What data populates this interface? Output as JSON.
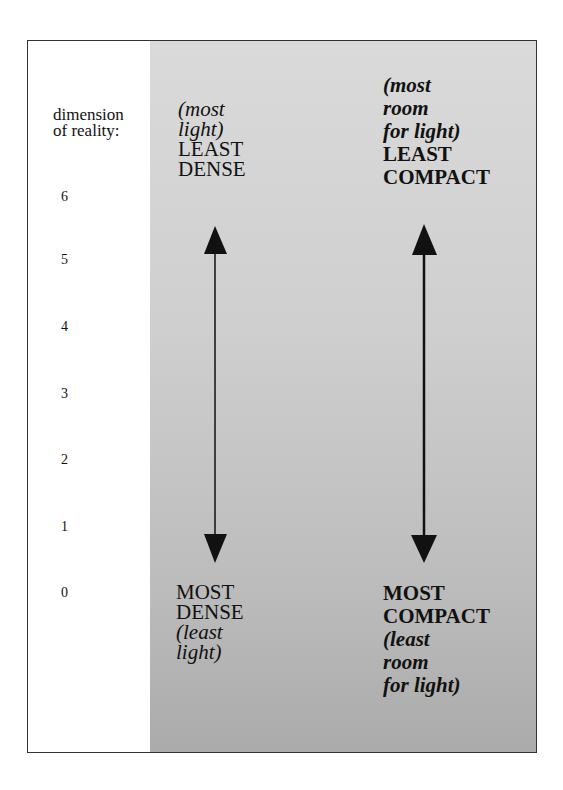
{
  "axis": {
    "label_line1": "dimension",
    "label_line2": "of reality:",
    "ticks": [
      "6",
      "5",
      "4",
      "3",
      "2",
      "1",
      "0"
    ]
  },
  "left_column": {
    "top_italic_1": "(most",
    "top_italic_2": "light)",
    "top_label_1": "LEAST",
    "top_label_2": "DENSE",
    "bottom_label_1": "MOST",
    "bottom_label_2": "DENSE",
    "bottom_italic_1": "(least",
    "bottom_italic_2": "light)"
  },
  "right_column": {
    "top_italic_1": "(most",
    "top_italic_2": "room",
    "top_italic_3": "for light)",
    "top_label_1": "LEAST",
    "top_label_2": "COMPACT",
    "bottom_label_1": "MOST",
    "bottom_label_2": "COMPACT",
    "bottom_italic_1": "(least",
    "bottom_italic_2": "room",
    "bottom_italic_3": "for light)"
  },
  "colors": {
    "shade_top": "#dadada",
    "shade_bottom": "#ababab",
    "ink": "#111111"
  }
}
